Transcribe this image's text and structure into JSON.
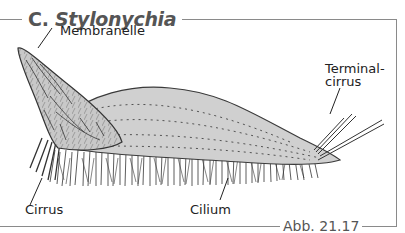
{
  "figure": {
    "title_prefix": "C.",
    "title_genus": "Stylonychia",
    "caption": "Abb. 21.17",
    "colors": {
      "body_fill": "#d0d0d0",
      "outline": "#3a3a3a",
      "frame": "#8a8a8a",
      "title_text": "#555555"
    }
  },
  "labels": {
    "membranelle": "Membranelle",
    "terminal_line1": "Terminal-",
    "terminal_line2": "cirrus",
    "cirrus": "Cirrus",
    "cilium": "Cilium"
  }
}
